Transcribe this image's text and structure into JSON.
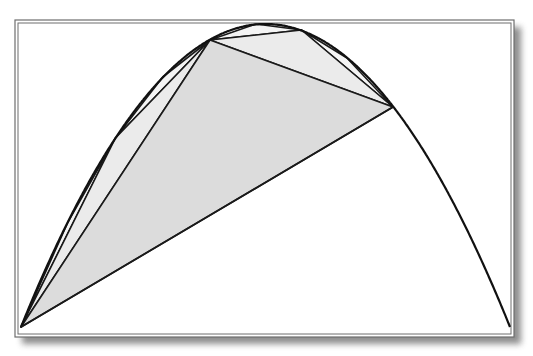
{
  "figure": {
    "colors": {
      "background": "#ffffff",
      "frame": "#6e6e6e",
      "shadow": "#7a7a7a",
      "curve": "#111111",
      "fill_level1": "#dcdcdc",
      "fill_level2": "#ebebeb",
      "fill_level3": "#f4f4f4",
      "line": "#1a1a1a"
    },
    "frame": {
      "outer": [
        15,
        20,
        514,
        337
      ],
      "inner": [
        18,
        23,
        511,
        334
      ]
    },
    "parabola": {
      "left": [
        21,
        327
      ],
      "right": [
        510,
        327
      ],
      "apex": [
        265.5,
        24
      ]
    },
    "triangles": {
      "level1": [
        [
          21,
          327
        ],
        [
          210,
          40
        ],
        [
          393,
          107
        ]
      ],
      "level2": [
        [
          [
            21,
            327
          ],
          [
            115.5,
            138
          ],
          [
            210,
            40
          ]
        ],
        [
          [
            210,
            40
          ],
          [
            301.5,
            30
          ],
          [
            393,
            107
          ]
        ]
      ],
      "level3": [
        [
          [
            21,
            327
          ],
          [
            68,
            222
          ],
          [
            115.5,
            138
          ]
        ],
        [
          [
            115.5,
            138
          ],
          [
            162.75,
            77
          ],
          [
            210,
            40
          ]
        ],
        [
          [
            210,
            40
          ],
          [
            255.75,
            24
          ],
          [
            301.5,
            30
          ]
        ],
        [
          [
            301.5,
            30
          ],
          [
            347,
            58
          ],
          [
            393,
            107
          ]
        ]
      ]
    }
  }
}
